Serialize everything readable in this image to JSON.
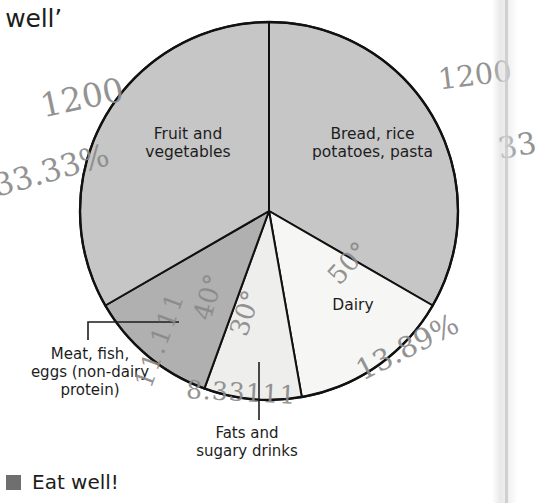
{
  "page": {
    "heading_fragment": "t well’",
    "background_color": "#ffffff"
  },
  "legend": {
    "swatch_color": "#6f6f6f",
    "label": "Eat well!"
  },
  "chart_data": {
    "type": "pie",
    "title": "Eat well!",
    "total_degrees": 360,
    "center": {
      "x": 269,
      "y": 211
    },
    "radius": 189,
    "start_angle_deg": 0,
    "direction": "clockwise",
    "categories": [
      "Bread, rice potatoes, pasta",
      "Dairy",
      "Fats and sugary drinks",
      "Meat, fish, eggs (non-dairy protein)",
      "Fruit and vegetables"
    ],
    "angles_deg": [
      120,
      50,
      30,
      40,
      120
    ],
    "percentages": [
      33.33,
      13.89,
      8.33,
      11.11,
      33.33
    ],
    "colors": [
      "#c6c6c6",
      "#f6f6f4",
      "#eeeeec",
      "#b0b0b0",
      "#c6c6c6"
    ],
    "stroke_color": "#111111",
    "stroke_width": 2,
    "slices": [
      {
        "label": "Bread, rice\npotatoes, pasta",
        "line1": "Bread, rice",
        "line2": "potatoes, pasta",
        "angle_deg": 120,
        "percent": 33.33,
        "color": "#c6c6c6",
        "start": 0,
        "end": 120
      },
      {
        "label": "Dairy",
        "line1": "Dairy",
        "line2": "",
        "angle_deg": 50,
        "percent": 13.89,
        "color": "#f6f6f4",
        "start": 120,
        "end": 170
      },
      {
        "label": "Fats and sugary drinks",
        "line1": "Fats and",
        "line2": "sugary drinks",
        "angle_deg": 30,
        "percent": 8.33,
        "color": "#eeeeec",
        "start": 170,
        "end": 200
      },
      {
        "label": "Meat, fish, eggs (non-dairy protein)",
        "line1": "Meat, fish,",
        "line2": "eggs (non-dairy",
        "line3": "protein)",
        "angle_deg": 40,
        "percent": 11.11,
        "color": "#b0b0b0",
        "start": 200,
        "end": 240
      },
      {
        "label": "Fruit and vegetables",
        "line1": "Fruit and",
        "line2": "vegetables",
        "angle_deg": 120,
        "percent": 33.33,
        "color": "#c6c6c6",
        "start": 240,
        "end": 360
      }
    ]
  },
  "labels": {
    "fruit_line1": "Fruit and",
    "fruit_line2": "vegetables",
    "bread_line1": "Bread, rice",
    "bread_line2": "potatoes, pasta",
    "dairy": "Dairy",
    "meat_line1": "Meat, fish,",
    "meat_line2": "eggs (non-dairy",
    "meat_line3": "protein)",
    "fats_line1": "Fats and",
    "fats_line2": "sugary drinks"
  },
  "annotations": {
    "pencil_color": "#8a8a8a",
    "items": [
      {
        "id": "hw-120-left",
        "text": "1200",
        "meaning": "120°"
      },
      {
        "id": "hw-3333",
        "text": "33.33%",
        "meaning": "33.33%"
      },
      {
        "id": "hw-120-right",
        "text": "1200",
        "meaning": "120°"
      },
      {
        "id": "hw-33-right",
        "text": "33",
        "meaning": "33 (cut off)"
      },
      {
        "id": "hw-40",
        "text": "40°",
        "meaning": "40°"
      },
      {
        "id": "hw-30",
        "text": "30°",
        "meaning": "30°"
      },
      {
        "id": "hw-50",
        "text": "50°",
        "meaning": "50°"
      },
      {
        "id": "hw-1111",
        "text": "11.111",
        "meaning": "11.11%"
      },
      {
        "id": "hw-833",
        "text": "8.33111",
        "meaning": "8.33%"
      },
      {
        "id": "hw-1389",
        "text": "13.89%",
        "meaning": "13.89%"
      }
    ],
    "hw_120_left": "1200",
    "hw_3333": "33.33%",
    "hw_120_right": "1200",
    "hw_33_right": "33",
    "hw_40": "40°",
    "hw_30": "30°",
    "hw_50": "50°",
    "hw_1111": "11.111",
    "hw_833": "8.33111",
    "hw_1389": "13.89%"
  }
}
